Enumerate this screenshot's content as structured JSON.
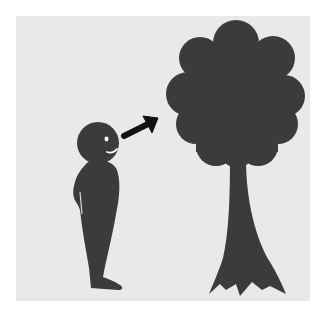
{
  "illustration": {
    "title": "Person looking at a tree",
    "elements": {
      "person": "person-silhouette",
      "arrow": "arrow-up-right-icon",
      "tree": "tree-silhouette"
    },
    "colors": {
      "background": "#e9e9e9",
      "border": "#ffffff",
      "silhouette": "#3b3b3b",
      "face_detail": "#ffffff"
    }
  }
}
